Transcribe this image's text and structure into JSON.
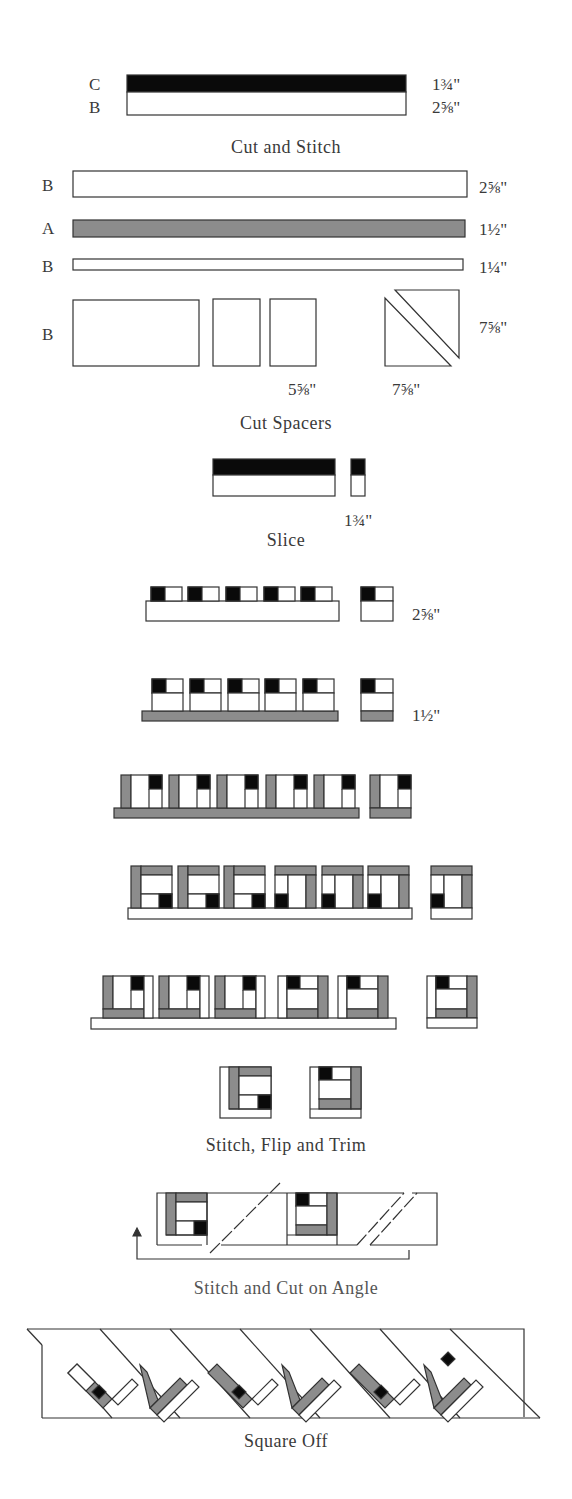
{
  "colors": {
    "dark": "#0a0a0a",
    "medium": "#8c8c8c",
    "light": "#ffffff",
    "stroke": "#333333"
  },
  "steps": [
    {
      "caption": "Cut and Stitch",
      "strips": [
        {
          "fabric": "C",
          "width": "1¾\""
        },
        {
          "fabric": "B",
          "width": "2⅝\""
        }
      ]
    },
    {
      "caption": "Cut Spacers",
      "strips": [
        {
          "fabric": "B",
          "width": "2⅝\""
        },
        {
          "fabric": "A",
          "width": "1½\""
        },
        {
          "fabric": "B",
          "width": "1¼\""
        }
      ],
      "spacers": {
        "fabric": "B",
        "rect_size": "5⅝\"",
        "square_width": "7⅝\"",
        "square_height": "7⅝\""
      }
    },
    {
      "caption": "Slice",
      "measure": "1¾\""
    },
    {
      "caption": "",
      "measure": "2⅝\""
    },
    {
      "caption": "",
      "measure": "1½\""
    },
    {
      "caption": "Stitch, Flip and Trim"
    },
    {
      "caption": "Stitch and Cut on Angle"
    },
    {
      "caption": "Square Off"
    }
  ]
}
